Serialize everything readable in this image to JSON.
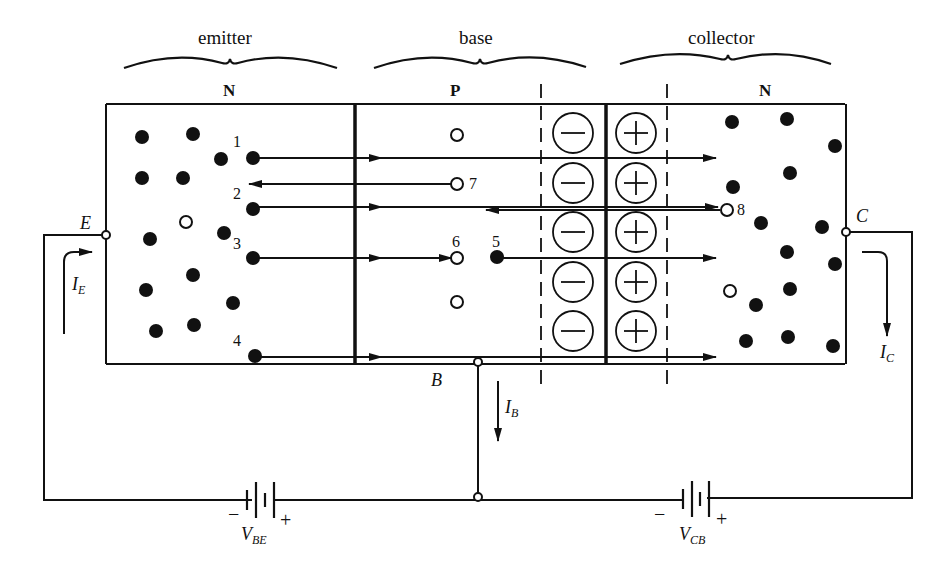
{
  "regions": {
    "emitter": {
      "title": "emitter",
      "type": "N"
    },
    "base": {
      "title": "base",
      "type": "P"
    },
    "collector": {
      "title": "collector",
      "type": "N"
    }
  },
  "carrier_labels": [
    "1",
    "2",
    "3",
    "4",
    "5",
    "6",
    "7",
    "8"
  ],
  "terminals": {
    "emitter": "E",
    "base": "B",
    "collector": "C"
  },
  "currents": {
    "emitter": {
      "main": "I",
      "sub": "E"
    },
    "base": {
      "main": "I",
      "sub": "B"
    },
    "collector": {
      "main": "I",
      "sub": "C"
    }
  },
  "sources": {
    "vbe": {
      "main": "V",
      "sub": "BE",
      "minus": "−",
      "plus": "+"
    },
    "vcb": {
      "main": "V",
      "sub": "CB",
      "minus": "−",
      "plus": "+"
    }
  },
  "depletion": {
    "negative_ions": 5,
    "positive_ions": 5,
    "negative_symbol": "minus",
    "positive_symbol": "plus"
  },
  "colors": {
    "ink": "#111111",
    "background": "#ffffff"
  }
}
